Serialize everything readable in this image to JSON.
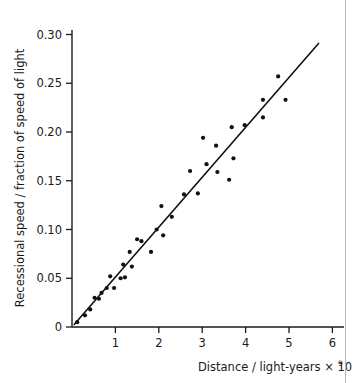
{
  "figure": {
    "kind": "scatter-plot",
    "background_color": "#ffffff",
    "ink_color": "#1a1a1a",
    "edge_rule_color": "#b9b9b9"
  },
  "axes": {
    "x": {
      "title_main": "Distance / light-years × 10",
      "title_exponent": "9",
      "ticks": [
        "1",
        "2",
        "3",
        "4",
        "5",
        "6"
      ],
      "tick_values": [
        1,
        2,
        3,
        4,
        5,
        6
      ],
      "origin_label": "0",
      "range": [
        0,
        6.3
      ]
    },
    "y": {
      "title": "Recessional speed / fraction of speed of light",
      "ticks": [
        "0",
        "0.05",
        "0.10",
        "0.15",
        "0.20",
        "0.25",
        "0.30"
      ],
      "tick_values": [
        0,
        0.05,
        0.1,
        0.15,
        0.2,
        0.25,
        0.3
      ],
      "range": [
        0,
        0.3075
      ]
    }
  },
  "chart_data": {
    "type": "scatter",
    "title": "",
    "xlabel": "Distance / light-years × 10^9",
    "ylabel": "Recessional speed / fraction of speed of light",
    "xlim": [
      0,
      6.3
    ],
    "ylim": [
      0,
      0.3075
    ],
    "grid": false,
    "legend": "none",
    "marker": {
      "shape": "circle",
      "color": "#111111",
      "size_px": 4.2
    },
    "points": [
      {
        "x": 0.12,
        "y": 0.005
      },
      {
        "x": 0.3,
        "y": 0.012
      },
      {
        "x": 0.42,
        "y": 0.018
      },
      {
        "x": 0.52,
        "y": 0.03
      },
      {
        "x": 0.62,
        "y": 0.029
      },
      {
        "x": 0.68,
        "y": 0.035
      },
      {
        "x": 0.8,
        "y": 0.04
      },
      {
        "x": 0.88,
        "y": 0.052
      },
      {
        "x": 0.97,
        "y": 0.04
      },
      {
        "x": 1.12,
        "y": 0.05
      },
      {
        "x": 1.18,
        "y": 0.064
      },
      {
        "x": 1.22,
        "y": 0.051
      },
      {
        "x": 1.33,
        "y": 0.077
      },
      {
        "x": 1.38,
        "y": 0.062
      },
      {
        "x": 1.5,
        "y": 0.09
      },
      {
        "x": 1.6,
        "y": 0.088
      },
      {
        "x": 1.82,
        "y": 0.077
      },
      {
        "x": 1.95,
        "y": 0.1
      },
      {
        "x": 2.06,
        "y": 0.124
      },
      {
        "x": 2.1,
        "y": 0.094
      },
      {
        "x": 2.3,
        "y": 0.113
      },
      {
        "x": 2.58,
        "y": 0.136
      },
      {
        "x": 2.72,
        "y": 0.16
      },
      {
        "x": 2.9,
        "y": 0.137
      },
      {
        "x": 3.02,
        "y": 0.194
      },
      {
        "x": 3.1,
        "y": 0.167
      },
      {
        "x": 3.32,
        "y": 0.186
      },
      {
        "x": 3.35,
        "y": 0.159
      },
      {
        "x": 3.62,
        "y": 0.151
      },
      {
        "x": 3.68,
        "y": 0.205
      },
      {
        "x": 3.72,
        "y": 0.173
      },
      {
        "x": 3.98,
        "y": 0.207
      },
      {
        "x": 4.4,
        "y": 0.233
      },
      {
        "x": 4.4,
        "y": 0.215
      },
      {
        "x": 4.75,
        "y": 0.257
      },
      {
        "x": 4.92,
        "y": 0.233
      }
    ],
    "fit_line": {
      "kind": "best-fit-straight-line",
      "slope": 0.0512,
      "intercept": 0.0,
      "x_start": 0.05,
      "x_end": 5.68,
      "color": "#111111",
      "width_px": 1.6
    }
  }
}
